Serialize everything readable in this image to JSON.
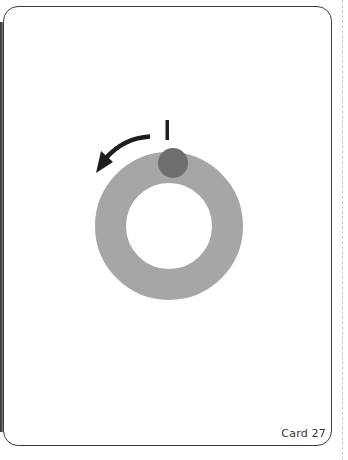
{
  "card": {
    "label": "Card 27",
    "border_color": "#3c3c3c"
  },
  "diagram": {
    "ring": {
      "center": [
        169,
        226
      ],
      "outer_radius": 74,
      "inner_radius": 43,
      "color": "#a6a6a6"
    },
    "marker_dot": {
      "center": [
        173,
        163
      ],
      "radius": 15,
      "color": "#6e6e6e"
    },
    "start_tick": {
      "x": 167,
      "y1": 120,
      "y2": 140,
      "color": "#1e1e1e"
    },
    "rotation_arrow": {
      "direction": "counter-clockwise",
      "color": "#1e1e1e"
    }
  },
  "icons": {
    "arrow": "curved-arrow-counterclockwise-icon",
    "tick": "start-marker-icon"
  }
}
